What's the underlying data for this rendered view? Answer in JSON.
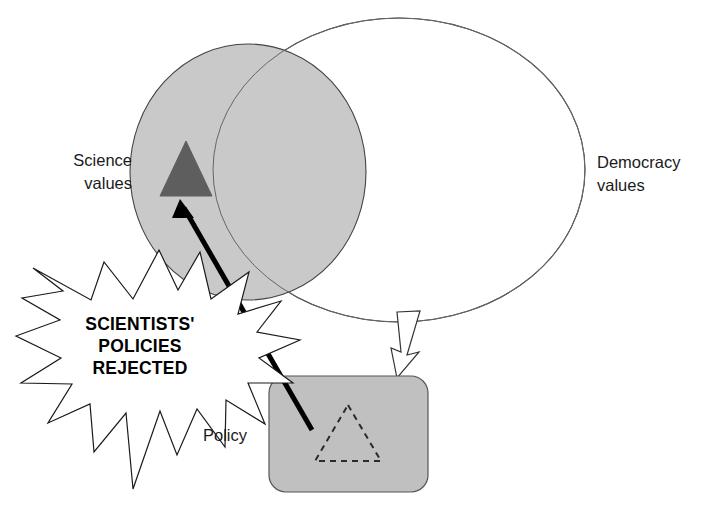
{
  "diagram": {
    "background_color": "#ffffff",
    "labels": {
      "science_values": {
        "line1": "Science",
        "line2": "values"
      },
      "democracy_values": {
        "line1": "Democracy",
        "line2": "values"
      },
      "policy": "Policy"
    },
    "burst": {
      "line1": "SCIENTISTS'",
      "line2": "POLICIES",
      "line3": "REJECTED",
      "fill_color": "#ffffff",
      "stroke_color": "#1a1a1a"
    },
    "shapes": {
      "science_circle": {
        "name": "Science values circle",
        "fill_color": "#c9c9c9",
        "stroke_color": "#444444"
      },
      "democracy_circle": {
        "name": "Democracy values circle",
        "fill_color": "none",
        "stroke_color": "#444444"
      },
      "science_triangle": {
        "name": "Science values triangle",
        "fill_color": "#5e5e5e",
        "stroke_color": "#5e5e5e"
      },
      "policy_box": {
        "name": "Policy box",
        "fill_color": "#c0c0c0",
        "stroke_color": "#555555"
      },
      "policy_triangle": {
        "name": "Rejected policy triangle (dashed)",
        "fill_color": "none",
        "stroke_color": "#2b2b2b",
        "stroke_style": "dashed"
      }
    },
    "connectors": {
      "thick_arrow": {
        "name": "Policy to science values arrow",
        "color": "#000000",
        "direction": "up-left"
      },
      "block_arrow": {
        "name": "Democracy values to policy block arrow",
        "fill_color": "#ffffff",
        "stroke_color": "#333333",
        "direction": "down-left"
      }
    }
  }
}
